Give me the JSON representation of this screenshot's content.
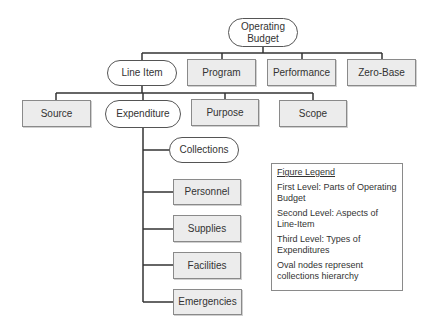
{
  "diagram": {
    "root": {
      "label": "Operating Budget",
      "shape": "oval"
    },
    "first_level": [
      {
        "label": "Line Item",
        "shape": "oval"
      },
      {
        "label": "Program",
        "shape": "rect"
      },
      {
        "label": "Performance",
        "shape": "rect"
      },
      {
        "label": "Zero-Base",
        "shape": "rect"
      }
    ],
    "second_level": [
      {
        "label": "Source",
        "shape": "rect"
      },
      {
        "label": "Expenditure",
        "shape": "oval"
      },
      {
        "label": "Purpose",
        "shape": "rect"
      },
      {
        "label": "Scope",
        "shape": "rect"
      }
    ],
    "third_level": [
      {
        "label": "Collections",
        "shape": "oval"
      },
      {
        "label": "Personnel",
        "shape": "rect"
      },
      {
        "label": "Supplies",
        "shape": "rect"
      },
      {
        "label": "Facilities",
        "shape": "rect"
      },
      {
        "label": "Emergencies",
        "shape": "rect"
      }
    ]
  },
  "legend": {
    "title": "Figure Legend",
    "items": [
      "First Level: Parts of Operating Budget",
      "Second Level: Aspects of Line-Item",
      "Third Level: Types of Expenditures",
      "Oval nodes represent collections hierarchy"
    ]
  },
  "colors": {
    "box_fill": "#ececec",
    "box_border": "#8a8a8a",
    "oval_border": "#555555",
    "connector": "#333333"
  }
}
